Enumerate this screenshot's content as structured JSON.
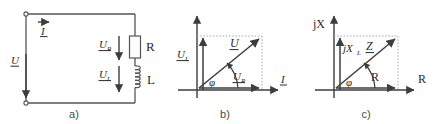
{
  "figure": {
    "background_color": "#ffffff",
    "line_color": "#555555",
    "text_color": "#2b2b2b",
    "dotted_color": "#aaaaaa"
  },
  "panels": [
    {
      "id": "a",
      "caption": "a)",
      "type": "circuit-schematic",
      "labels": {
        "current": "I",
        "source_voltage": "U",
        "resistor_voltage": "U",
        "resistor_voltage_sub": "R",
        "inductor_voltage": "U",
        "inductor_voltage_sub": "L",
        "resistor": "R",
        "inductor": "L"
      }
    },
    {
      "id": "b",
      "caption": "b)",
      "type": "phasor-diagram",
      "labels": {
        "axis_horizontal": "I",
        "vector_total": "U",
        "vector_resistive": "U",
        "vector_resistive_sub": "R",
        "vector_inductive": "U",
        "vector_inductive_sub": "L",
        "angle": "φ"
      }
    },
    {
      "id": "c",
      "caption": "c)",
      "type": "impedance-triangle",
      "labels": {
        "axis_vertical": "jX",
        "axis_horizontal": "R",
        "vector_impedance": "Z",
        "vector_reactive": "jX",
        "vector_reactive_sub": "L",
        "vector_resistive": "R",
        "angle": "φ"
      }
    }
  ]
}
